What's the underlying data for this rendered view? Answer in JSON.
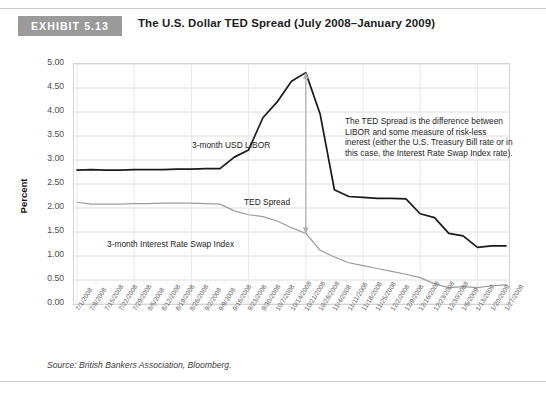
{
  "header": {
    "badge": "EXHIBIT 5.13",
    "title": "The U.S. Dollar TED Spread (July 2008–January 2009)"
  },
  "footer": {
    "source": "Source: British Bankers Association, Bloomberg."
  },
  "annotations": {
    "libor_label": "3-month USD LIBOR",
    "swap_label": "3-month Interest Rate Swap Index",
    "ted_label": "TED Spread",
    "note": "The TED Spread is the difference between LIBOR and some measure of risk-less inerest (either the U.S. Treasury Bill rate or in this case, the Interest Rate Swap Index rate)."
  },
  "colors": {
    "badge": "#9a9a9a",
    "libor": "#1a1a1a",
    "swap": "#9b9b9b",
    "grid": "#dcdcdc",
    "arrow": "#b0b0b0"
  },
  "chart_data": {
    "type": "line",
    "title": "The U.S. Dollar TED Spread (July 2008–January 2009)",
    "xlabel": "",
    "ylabel": "Percent",
    "ylim": [
      0.0,
      5.0
    ],
    "ytick_step": 0.5,
    "yticks": [
      "0.00",
      "0.50",
      "1.00",
      "1.50",
      "2.00",
      "2.50",
      "3.00",
      "3.50",
      "4.00",
      "4.50",
      "5.00"
    ],
    "grid": true,
    "legend_position": "in-plot-labels",
    "categories": [
      "7/1/2008",
      "7/8/2008",
      "7/15/2008",
      "7/22/2008",
      "7/29/2008",
      "8/5/2008",
      "8/12/2008",
      "8/19/2008",
      "8/26/2008",
      "9/2/2008",
      "9/9/2008",
      "9/16/2008",
      "9/23/2008",
      "9/30/2008",
      "10/7/2008",
      "10/14/2008",
      "10/21/2008",
      "10/28/2008",
      "11/4/2008",
      "11/11/2008",
      "11/18/2008",
      "11/25/2008",
      "12/2/2008",
      "12/9/2008",
      "12/16/2008",
      "12/23/2008",
      "12/30/2008",
      "1/6/2009",
      "1/13/2009",
      "1/20/2009",
      "1/27/2009"
    ],
    "series": [
      {
        "name": "3-month USD LIBOR",
        "color": "#1a1a1a",
        "values": [
          2.79,
          2.8,
          2.79,
          2.79,
          2.8,
          2.8,
          2.8,
          2.81,
          2.81,
          2.82,
          2.82,
          3.06,
          3.21,
          3.88,
          4.21,
          4.64,
          4.82,
          3.96,
          2.38,
          2.24,
          2.22,
          2.2,
          2.2,
          2.19,
          1.88,
          1.8,
          1.47,
          1.42,
          1.18,
          1.21,
          1.21
        ]
      },
      {
        "name": "3-month Interest Rate Swap Index",
        "color": "#9b9b9b",
        "values": [
          2.12,
          2.08,
          2.08,
          2.08,
          2.09,
          2.09,
          2.1,
          2.1,
          2.1,
          2.09,
          2.08,
          1.94,
          1.86,
          1.82,
          1.73,
          1.59,
          1.47,
          1.12,
          0.98,
          0.86,
          0.8,
          0.74,
          0.68,
          0.62,
          0.55,
          0.42,
          0.34,
          0.36,
          0.34,
          0.38,
          0.4
        ]
      }
    ],
    "callout_arrow": {
      "at_category": "10/21/2008",
      "top_value": 4.82,
      "bottom_value": 1.47,
      "label": "TED Spread"
    }
  }
}
